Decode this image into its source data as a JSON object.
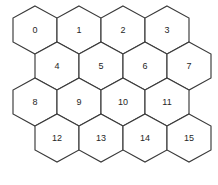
{
  "figure": {
    "name": "hexagonal-grid",
    "kind": "hex-tessellation",
    "width": 218,
    "height": 185,
    "background_color": "#ffffff",
    "stroke_color": "#3a3a3a",
    "label_color": "#262626",
    "fill_color": "#ffffff"
  },
  "geometry": {
    "orientation": "pointy-top",
    "hex_width": 44,
    "hex_height": 48,
    "row_step_y": 36,
    "row_offset_x": 22,
    "rows": 4,
    "columns": 4,
    "origin_x": 13,
    "origin_y": 6
  },
  "cells": [
    {
      "label": "0",
      "row": 0,
      "col": 0,
      "cx": 35,
      "cy": 30
    },
    {
      "label": "1",
      "row": 0,
      "col": 1,
      "cx": 79,
      "cy": 30
    },
    {
      "label": "2",
      "row": 0,
      "col": 2,
      "cx": 123,
      "cy": 30
    },
    {
      "label": "3",
      "row": 0,
      "col": 3,
      "cx": 167,
      "cy": 30
    },
    {
      "label": "4",
      "row": 1,
      "col": 0,
      "cx": 57,
      "cy": 66
    },
    {
      "label": "5",
      "row": 1,
      "col": 1,
      "cx": 101,
      "cy": 66
    },
    {
      "label": "6",
      "row": 1,
      "col": 2,
      "cx": 145,
      "cy": 66
    },
    {
      "label": "7",
      "row": 1,
      "col": 3,
      "cx": 189,
      "cy": 66
    },
    {
      "label": "8",
      "row": 2,
      "col": 0,
      "cx": 35,
      "cy": 102
    },
    {
      "label": "9",
      "row": 2,
      "col": 1,
      "cx": 79,
      "cy": 102
    },
    {
      "label": "10",
      "row": 2,
      "col": 2,
      "cx": 123,
      "cy": 102
    },
    {
      "label": "11",
      "row": 2,
      "col": 3,
      "cx": 167,
      "cy": 102
    },
    {
      "label": "12",
      "row": 3,
      "col": 0,
      "cx": 57,
      "cy": 138
    },
    {
      "label": "13",
      "row": 3,
      "col": 1,
      "cx": 101,
      "cy": 138
    },
    {
      "label": "14",
      "row": 3,
      "col": 2,
      "cx": 145,
      "cy": 138
    },
    {
      "label": "15",
      "row": 3,
      "col": 3,
      "cx": 189,
      "cy": 138
    }
  ]
}
